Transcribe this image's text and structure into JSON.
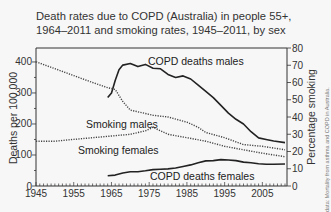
{
  "title_line1": "Death rates due to COPD (Australia) in people 55+,",
  "title_line2": "1964–2011 and smoking rates, 1945–2011, by sex",
  "source_note": "data: Mortality from asthma and COPD in Australia.",
  "chart_data": {
    "type": "line",
    "title": "Death rates due to COPD (Australia) in people 55+, 1964–2011 and smoking rates, 1945–2011, by sex",
    "xlabel": "",
    "ylabel": "Deaths per 100 000",
    "y2label": "Percentage smoking",
    "xlim": [
      1945,
      2011
    ],
    "ylim": [
      0,
      445
    ],
    "y2lim": [
      0,
      80
    ],
    "x_ticks": [
      "1945",
      "1955",
      "1965",
      "1975",
      "1985",
      "1995",
      "2005"
    ],
    "y_ticks": [
      "0",
      "100",
      "200",
      "300",
      "400"
    ],
    "y2_ticks": [
      "0",
      "10",
      "20",
      "30",
      "40",
      "50",
      "60",
      "70",
      "80"
    ],
    "grid": false,
    "legend": "inline labels",
    "series": [
      {
        "name": "COPD deaths males",
        "axis": "left",
        "style": "solid",
        "x": [
          1964,
          1965,
          1966,
          1967,
          1968,
          1970,
          1972,
          1974,
          1976,
          1978,
          1980,
          1982,
          1984,
          1986,
          1988,
          1990,
          1992,
          1994,
          1996,
          1998,
          2000,
          2002,
          2004,
          2006,
          2008,
          2011
        ],
        "values": [
          285,
          300,
          340,
          375,
          390,
          395,
          385,
          392,
          380,
          378,
          360,
          350,
          355,
          345,
          325,
          305,
          285,
          260,
          235,
          215,
          200,
          175,
          155,
          150,
          145,
          140
        ]
      },
      {
        "name": "COPD deaths females",
        "axis": "left",
        "style": "solid",
        "x": [
          1964,
          1966,
          1968,
          1970,
          1972,
          1974,
          1976,
          1978,
          1980,
          1982,
          1984,
          1986,
          1988,
          1990,
          1992,
          1994,
          1996,
          1998,
          2000,
          2002,
          2004,
          2006,
          2008,
          2011
        ],
        "values": [
          33,
          35,
          42,
          46,
          46,
          49,
          53,
          54,
          55,
          58,
          63,
          68,
          75,
          81,
          82,
          85,
          84,
          82,
          77,
          75,
          72,
          70,
          70,
          71
        ]
      },
      {
        "name": "Smoking males",
        "axis": "right",
        "style": "dotted",
        "x": [
          1945,
          1950,
          1955,
          1960,
          1964,
          1966,
          1968,
          1970,
          1974,
          1976,
          1980,
          1985,
          1988,
          1990,
          1995,
          2000,
          2005,
          2011
        ],
        "values": [
          72,
          68,
          64,
          60,
          57,
          56,
          49,
          44,
          42,
          41,
          40,
          37,
          34,
          31,
          28,
          24,
          23,
          21
        ]
      },
      {
        "name": "Smoking females",
        "axis": "right",
        "style": "dotted",
        "x": [
          1945,
          1950,
          1955,
          1960,
          1965,
          1970,
          1974,
          1976,
          1980,
          1985,
          1990,
          1995,
          2000,
          2005,
          2011
        ],
        "values": [
          26,
          26,
          27,
          28,
          29,
          30,
          32,
          34,
          30,
          28,
          26,
          23,
          21,
          19,
          17
        ]
      }
    ]
  },
  "series_labels": {
    "copd_males": "COPD deaths males",
    "copd_females": "COPD deaths females",
    "smoking_males": "Smoking males",
    "smoking_females": "Smoking females"
  }
}
